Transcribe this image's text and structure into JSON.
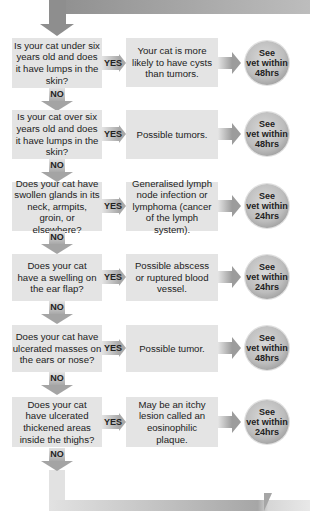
{
  "flowchart": {
    "rows": [
      {
        "question": "Is your cat under six years old and does it have lumps in the skin?",
        "yes_label": "YES",
        "answer": "Your cat is more likely to have cysts than tumors.",
        "action_line1": "See",
        "action_line2": "vet within",
        "action_line3": "48hrs",
        "no_label": "NO"
      },
      {
        "question": "Is your cat over six years old and does it have lumps in the skin?",
        "yes_label": "YES",
        "answer": "Possible tumors.",
        "action_line1": "See",
        "action_line2": "vet within",
        "action_line3": "48hrs",
        "no_label": "NO"
      },
      {
        "question": "Does your cat have swollen glands in its neck, armpits, groin, or elsewhere?",
        "yes_label": "YES",
        "answer": "Generalised lymph node infection or lymphoma (cancer of the lymph system).",
        "action_line1": "See",
        "action_line2": "vet within",
        "action_line3": "24hrs",
        "no_label": "NO"
      },
      {
        "question": "Does your cat have a swelling on the ear flap?",
        "yes_label": "YES",
        "answer": "Possible abscess or ruptured blood vessel.",
        "action_line1": "See",
        "action_line2": "vet within",
        "action_line3": "24hrs",
        "no_label": "NO"
      },
      {
        "question": "Does your cat have ulcerated masses on the ears or nose?",
        "yes_label": "YES",
        "answer": "Possible tumor.",
        "action_line1": "See",
        "action_line2": "vet within",
        "action_line3": "48hrs",
        "no_label": "NO"
      },
      {
        "question": "Does your cat have ulcerated thickened areas inside the thighs?",
        "yes_label": "YES",
        "answer": "May be an itchy lesion called an eosinophilic plaque.",
        "action_line1": "See",
        "action_line2": "vet within",
        "action_line3": "24hrs",
        "no_label": "NO"
      }
    ]
  },
  "colors": {
    "box": "#e4e4e4",
    "arrow_dark": "#8e8e8e",
    "arrow_light": "#e2e2e2"
  }
}
